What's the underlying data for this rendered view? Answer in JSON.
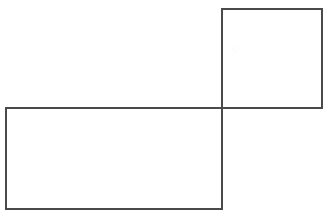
{
  "figure": {
    "background_color": "#ffffff",
    "stroke_color": "#4a4a4a",
    "stroke_width": 1.1,
    "canvas": {
      "width": 329,
      "height": 221
    },
    "shapes": [
      {
        "name": "square",
        "label": "upper-right square",
        "x": 222,
        "y": 9,
        "width": 100,
        "height": 99,
        "fill": "#ffffff"
      },
      {
        "name": "rectangle",
        "label": "lower-left rectangle",
        "x": 6,
        "y": 108,
        "width": 216,
        "height": 101,
        "fill": "#ffffff"
      }
    ],
    "shared_vertex": {
      "x": 222,
      "y": 108
    },
    "artifact": {
      "name": "scan-smudge",
      "x": 233,
      "y": 46,
      "width": 7,
      "height": 9
    }
  },
  "chart_data": {
    "type": "diagram",
    "xlabel": "",
    "ylabel": "",
    "grid": false,
    "legend": "none",
    "xlim": [
      0,
      329
    ],
    "ylim": [
      0,
      221
    ],
    "elements": [
      {
        "shape": "rectangle",
        "role": "square",
        "corners": [
          [
            222,
            9
          ],
          [
            322,
            9
          ],
          [
            322,
            108
          ],
          [
            222,
            108
          ]
        ],
        "width": 100,
        "height": 99,
        "stroke": "#4a4a4a",
        "fill": "#ffffff"
      },
      {
        "shape": "rectangle",
        "role": "rectangle",
        "corners": [
          [
            6,
            108
          ],
          [
            222,
            108
          ],
          [
            222,
            209
          ],
          [
            6,
            209
          ]
        ],
        "width": 216,
        "height": 101,
        "stroke": "#4a4a4a",
        "fill": "#ffffff"
      }
    ],
    "annotations": []
  }
}
